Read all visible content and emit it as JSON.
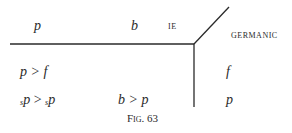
{
  "diagram": {
    "header": {
      "col1": "p",
      "col2": "b",
      "ie_label": "IE",
      "germanic_label": "GERMANIC"
    },
    "rows": [
      {
        "col1": "p > f",
        "col2": "",
        "germanic": "f"
      },
      {
        "col1_prefix": "s",
        "col1_a": "p",
        "col1_op": " > ",
        "col1_prefix2": "s",
        "col1_b": "p",
        "col2": "b > p",
        "germanic": "p"
      }
    ],
    "caption": "Fig. 63",
    "line_color": "#2a2a2a"
  }
}
